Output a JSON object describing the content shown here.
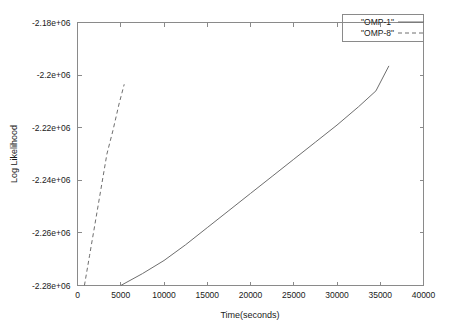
{
  "chart_data": {
    "type": "line",
    "title": "",
    "xlabel": "Time(seconds)",
    "ylabel": "Log Likelihood",
    "xlim": [
      0,
      40000
    ],
    "ylim": [
      -2280000,
      -2180000
    ],
    "grid": false,
    "legend_position": "top-right",
    "xticks": [
      0,
      5000,
      10000,
      15000,
      20000,
      25000,
      30000,
      35000,
      40000
    ],
    "xtick_labels": [
      "0",
      "5000",
      "10000",
      "15000",
      "20000",
      "25000",
      "30000",
      "35000",
      "40000"
    ],
    "yticks": [
      -2280000,
      -2260000,
      -2240000,
      -2220000,
      -2200000,
      -2180000
    ],
    "ytick_labels": [
      "-2.28e+06",
      "-2.26e+06",
      "-2.24e+06",
      "-2.22e+06",
      "-2.2e+06",
      "-2.18e+06"
    ],
    "series": [
      {
        "name": "\"OMP-1\"",
        "style": "solid",
        "color": "#6e6e6e",
        "x": [
          5000,
          7500,
          10000,
          12500,
          15000,
          17500,
          20000,
          22500,
          25000,
          27500,
          30000,
          32500,
          34500,
          36000
        ],
        "y": [
          -2280000,
          -2275500,
          -2270500,
          -2264500,
          -2258000,
          -2251500,
          -2245000,
          -2238500,
          -2232000,
          -2225500,
          -2219000,
          -2212000,
          -2206000,
          -2196500
        ]
      },
      {
        "name": "\"OMP-8\"",
        "style": "dashed",
        "color": "#6e6e6e",
        "x": [
          800,
          1400,
          2000,
          2700,
          3400,
          4100,
          4800,
          5400
        ],
        "y": [
          -2280000,
          -2268500,
          -2257000,
          -2243500,
          -2230000,
          -2221000,
          -2211000,
          -2203500
        ]
      }
    ]
  },
  "legend": {
    "entries": [
      {
        "label": "\"OMP-1\"",
        "style": "solid"
      },
      {
        "label": "\"OMP-8\"",
        "style": "dashed"
      }
    ]
  },
  "axes": {
    "x_title": "Time(seconds)",
    "y_title": "Log Likelihood"
  }
}
